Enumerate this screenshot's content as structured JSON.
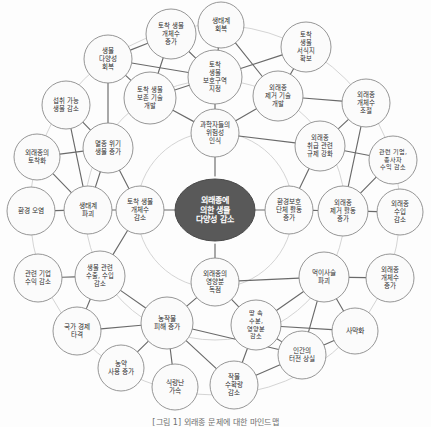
{
  "diagram": {
    "caption": "[그림 1] 외래종 문제에 대한 마인드맵",
    "center": {
      "id": "center",
      "label": "외래종에 의한 생물 다양성 감소",
      "lines": [
        "외래종에",
        "의한 생물",
        "다양성 감소"
      ],
      "color": "#595959",
      "text_color": "#ffffff"
    },
    "node_style": {
      "fill": "#fbfbfb",
      "stroke": "#8a8a8a",
      "text_color": "#2b2b2b"
    },
    "ring_color": "#cfcfcf",
    "edge_color": "#6a6a6a",
    "nodes": [
      {
        "id": "n01",
        "lines": [
          "과학자들의",
          "위험성",
          "인식"
        ],
        "label": "과학자들의 위험성 인식",
        "cx": 215,
        "cy": 133,
        "r": 24,
        "fs": 6.6,
        "ring": 1
      },
      {
        "id": "n02",
        "lines": [
          "환경보호",
          "단체 활동",
          "증가"
        ],
        "label": "환경보호 단체 활동 증가",
        "cx": 289,
        "cy": 210,
        "r": 24,
        "fs": 6.6,
        "ring": 1
      },
      {
        "id": "n03",
        "lines": [
          "외래종의",
          "영양분",
          "독점"
        ],
        "label": "외래종의 영양분 독점",
        "cx": 215,
        "cy": 282,
        "r": 24,
        "fs": 6.6,
        "ring": 1
      },
      {
        "id": "n04",
        "lines": [
          "토착 생물",
          "개체수",
          "감소"
        ],
        "label": "토착 생물 개체수 감소",
        "cx": 140,
        "cy": 210,
        "r": 24,
        "fs": 6.6,
        "ring": 1
      },
      {
        "id": "n05",
        "lines": [
          "토착",
          "생물",
          "보호구역",
          "지정"
        ],
        "label": "토착 생물 보호구역 지정",
        "cx": 215,
        "cy": 77,
        "r": 27,
        "fs": 6.4,
        "ring": 2
      },
      {
        "id": "n06",
        "lines": [
          "외래종",
          "제거 기술",
          "개발"
        ],
        "label": "외래종 제거 기술 개발",
        "cx": 278,
        "cy": 96,
        "r": 25,
        "fs": 6.4,
        "ring": 2
      },
      {
        "id": "n07",
        "lines": [
          "외래종",
          "취급 관련",
          "규제 강화"
        ],
        "label": "외래종 취급 관련 규제 강화",
        "cx": 320,
        "cy": 146,
        "r": 25,
        "fs": 6.3,
        "ring": 2
      },
      {
        "id": "n08",
        "lines": [
          "외래종",
          "제거 활동",
          "증가"
        ],
        "label": "외래종 제거 활동 증가",
        "cx": 343,
        "cy": 211,
        "r": 25,
        "fs": 6.4,
        "ring": 2
      },
      {
        "id": "n09",
        "lines": [
          "먹이사슬",
          "파괴"
        ],
        "label": "먹이사슬 파괴",
        "cx": 324,
        "cy": 277,
        "r": 25,
        "fs": 6.6,
        "ring": 2
      },
      {
        "id": "n10",
        "lines": [
          "사막화"
        ],
        "label": "사막화",
        "cx": 355,
        "cy": 331,
        "r": 23,
        "fs": 7.0,
        "ring": 2
      },
      {
        "id": "n11",
        "lines": [
          "인간의",
          "터전 상실"
        ],
        "label": "인간의 터전 상실",
        "cx": 302,
        "cy": 355,
        "r": 24,
        "fs": 6.6,
        "ring": 2
      },
      {
        "id": "n12",
        "lines": [
          "땅 속",
          "수분,",
          "영양분",
          "감소"
        ],
        "label": "땅 속 수분, 영양분 감소",
        "cx": 256,
        "cy": 325,
        "r": 25,
        "fs": 6.2,
        "ring": 2
      },
      {
        "id": "n13",
        "lines": [
          "농작물",
          "피해 증가"
        ],
        "label": "농작물 피해 증가",
        "cx": 167,
        "cy": 323,
        "r": 26,
        "fs": 6.7,
        "ring": 2
      },
      {
        "id": "n14",
        "lines": [
          "생물 관련",
          "수출, 수입",
          "감소"
        ],
        "label": "생물 관련 수출, 수입 감소",
        "cx": 100,
        "cy": 276,
        "r": 25,
        "fs": 6.3,
        "ring": 2
      },
      {
        "id": "n15",
        "lines": [
          "생태계",
          "파괴"
        ],
        "label": "생태계 파괴",
        "cx": 88,
        "cy": 210,
        "r": 24,
        "fs": 6.7,
        "ring": 2
      },
      {
        "id": "n16",
        "lines": [
          "멸종 위기",
          "생물 증가"
        ],
        "label": "멸종 위기 생물 증가",
        "cx": 108,
        "cy": 148,
        "r": 25,
        "fs": 6.5,
        "ring": 2
      },
      {
        "id": "n17",
        "lines": [
          "토착 생물",
          "보존 기술",
          "개발"
        ],
        "label": "토착 생물 보존 기술 개발",
        "cx": 150,
        "cy": 98,
        "r": 26,
        "fs": 6.3,
        "ring": 2
      },
      {
        "id": "n18",
        "lines": [
          "토착 생물",
          "개체수",
          "증가"
        ],
        "label": "토착 생물 개체수 증가",
        "cx": 171,
        "cy": 34,
        "r": 25,
        "fs": 6.4,
        "ring": 3
      },
      {
        "id": "n19",
        "lines": [
          "생태계",
          "회복"
        ],
        "label": "생태계 회복",
        "cx": 221,
        "cy": 25,
        "r": 23,
        "fs": 6.7,
        "ring": 3
      },
      {
        "id": "n20",
        "lines": [
          "토착",
          "생물",
          "서식지",
          "확보"
        ],
        "label": "토착 생물 서식지 확보",
        "cx": 306,
        "cy": 47,
        "r": 25,
        "fs": 6.3,
        "ring": 3
      },
      {
        "id": "n21",
        "lines": [
          "외래종",
          "개체수",
          "조절"
        ],
        "label": "외래종 개체수 조절",
        "cx": 366,
        "cy": 103,
        "r": 24,
        "fs": 6.5,
        "ring": 3
      },
      {
        "id": "n22",
        "lines": [
          "관련 기업,",
          "종사자",
          "수익 감소"
        ],
        "label": "관련 기업, 종사자 수익 감소",
        "cx": 393,
        "cy": 160,
        "r": 24,
        "fs": 6.1,
        "ring": 3
      },
      {
        "id": "n23",
        "lines": [
          "외래종",
          "수입",
          "감소"
        ],
        "label": "외래종 수입 감소",
        "cx": 400,
        "cy": 212,
        "r": 23,
        "fs": 6.5,
        "ring": 3
      },
      {
        "id": "n24",
        "lines": [
          "외래종",
          "개체수",
          "증가"
        ],
        "label": "외래종 개체수 증가",
        "cx": 390,
        "cy": 278,
        "r": 24,
        "fs": 6.5,
        "ring": 3
      },
      {
        "id": "n25",
        "lines": [
          "작물",
          "수확량",
          "감소"
        ],
        "label": "작물 수확량 감소",
        "cx": 234,
        "cy": 385,
        "r": 24,
        "fs": 6.5,
        "ring": 3
      },
      {
        "id": "n26",
        "lines": [
          "식량난",
          "가속"
        ],
        "label": "식량난 가속",
        "cx": 175,
        "cy": 387,
        "r": 23,
        "fs": 6.7,
        "ring": 3
      },
      {
        "id": "n27",
        "lines": [
          "농약",
          "사용 증가"
        ],
        "label": "농약 사용 증가",
        "cx": 121,
        "cy": 368,
        "r": 23,
        "fs": 6.6,
        "ring": 3
      },
      {
        "id": "n28",
        "lines": [
          "국가 경제",
          "타격"
        ],
        "label": "국가 경제 타격",
        "cx": 77,
        "cy": 331,
        "r": 24,
        "fs": 6.6,
        "ring": 3
      },
      {
        "id": "n29",
        "lines": [
          "관련 기업",
          "수익 감소"
        ],
        "label": "관련 기업 수익 감소",
        "cx": 38,
        "cy": 278,
        "r": 24,
        "fs": 6.4,
        "ring": 3
      },
      {
        "id": "n30",
        "lines": [
          "환경 오염"
        ],
        "label": "환경 오염",
        "cx": 31,
        "cy": 211,
        "r": 24,
        "fs": 6.7,
        "ring": 3
      },
      {
        "id": "n31",
        "lines": [
          "외래종의",
          "토착화"
        ],
        "label": "외래종의 토착화",
        "cx": 37,
        "cy": 157,
        "r": 23,
        "fs": 6.6,
        "ring": 3
      },
      {
        "id": "n32",
        "lines": [
          "섭취 가능",
          "생물 감소"
        ],
        "label": "섭취 가능 생물 감소",
        "cx": 66,
        "cy": 105,
        "r": 24,
        "fs": 6.4,
        "ring": 3
      },
      {
        "id": "n33",
        "lines": [
          "생물",
          "다양성",
          "회복"
        ],
        "label": "생물 다양성 회복",
        "cx": 108,
        "cy": 59,
        "r": 24,
        "fs": 6.5,
        "ring": 3
      }
    ],
    "rings": [
      {
        "cx": 215,
        "cy": 210,
        "r": 78
      },
      {
        "cx": 215,
        "cy": 210,
        "r": 130
      },
      {
        "cx": 215,
        "cy": 210,
        "r": 185
      }
    ],
    "edges": [
      [
        "center",
        "n01"
      ],
      [
        "center",
        "n02"
      ],
      [
        "center",
        "n03"
      ],
      [
        "center",
        "n04"
      ],
      [
        "n01",
        "n05"
      ],
      [
        "n01",
        "n06"
      ],
      [
        "n01",
        "n07"
      ],
      [
        "n01",
        "n17"
      ],
      [
        "n02",
        "n07"
      ],
      [
        "n02",
        "n08"
      ],
      [
        "n03",
        "n09"
      ],
      [
        "n03",
        "n12"
      ],
      [
        "n03",
        "n13"
      ],
      [
        "n04",
        "n14"
      ],
      [
        "n04",
        "n15"
      ],
      [
        "n04",
        "n16"
      ],
      [
        "n05",
        "n18"
      ],
      [
        "n05",
        "n19"
      ],
      [
        "n05",
        "n20"
      ],
      [
        "n05",
        "n17"
      ],
      [
        "n05",
        "n33"
      ],
      [
        "n06",
        "n20"
      ],
      [
        "n06",
        "n21"
      ],
      [
        "n06",
        "n19"
      ],
      [
        "n07",
        "n21"
      ],
      [
        "n07",
        "n22"
      ],
      [
        "n08",
        "n22"
      ],
      [
        "n08",
        "n23"
      ],
      [
        "n08",
        "n21"
      ],
      [
        "n09",
        "n24"
      ],
      [
        "n09",
        "n10"
      ],
      [
        "n09",
        "n11"
      ],
      [
        "n09",
        "n12"
      ],
      [
        "n10",
        "n11"
      ],
      [
        "n10",
        "n12"
      ],
      [
        "n11",
        "n12"
      ],
      [
        "n11",
        "n25"
      ],
      [
        "n12",
        "n25"
      ],
      [
        "n13",
        "n25"
      ],
      [
        "n13",
        "n26"
      ],
      [
        "n13",
        "n27"
      ],
      [
        "n13",
        "n28"
      ],
      [
        "n13",
        "n14"
      ],
      [
        "n13",
        "n11"
      ],
      [
        "n14",
        "n28"
      ],
      [
        "n14",
        "n29"
      ],
      [
        "n15",
        "n30"
      ],
      [
        "n15",
        "n31"
      ],
      [
        "n15",
        "n32"
      ],
      [
        "n15",
        "n16"
      ],
      [
        "n16",
        "n31"
      ],
      [
        "n16",
        "n32"
      ],
      [
        "n16",
        "n33"
      ],
      [
        "n17",
        "n33"
      ],
      [
        "n17",
        "n18"
      ],
      [
        "n18",
        "n33"
      ]
    ]
  }
}
